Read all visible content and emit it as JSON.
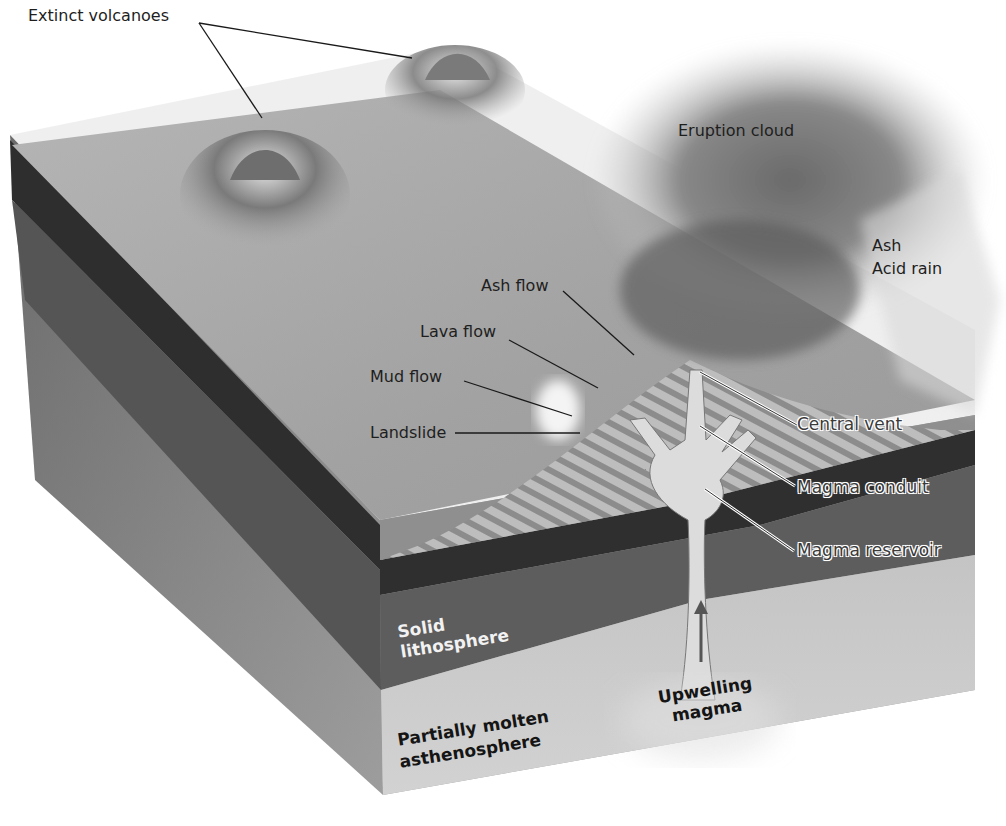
{
  "diagram": {
    "labels": {
      "extinct_volcanoes": "Extinct volcanoes",
      "eruption_cloud": "Eruption cloud",
      "ash": "Ash",
      "acid_rain": "Acid rain",
      "ash_flow": "Ash flow",
      "lava_flow": "Lava flow",
      "mud_flow": "Mud flow",
      "landslide": "Landslide",
      "central_vent": "Central vent",
      "magma_conduit": "Magma conduit",
      "magma_reservoir": "Magma reservoir",
      "solid_lithosphere_1": "Solid",
      "solid_lithosphere_2": "lithosphere",
      "asthenosphere_1": "Partially molten",
      "asthenosphere_2": "asthenosphere",
      "upwelling_1": "Upwelling",
      "upwelling_2": "magma"
    },
    "layers": [
      {
        "name": "Surface / crust",
        "color": "#9a9a9a"
      },
      {
        "name": "Dark crust band",
        "color": "#3a3a3a"
      },
      {
        "name": "Solid lithosphere",
        "color": "#5e5e5e"
      },
      {
        "name": "Partially molten asthenosphere",
        "color": "#bdbdbd"
      }
    ],
    "colors": {
      "magma": "#d9d9d9",
      "cloud": "#8a8a8a",
      "leader_line": "#1a1a1a"
    }
  }
}
